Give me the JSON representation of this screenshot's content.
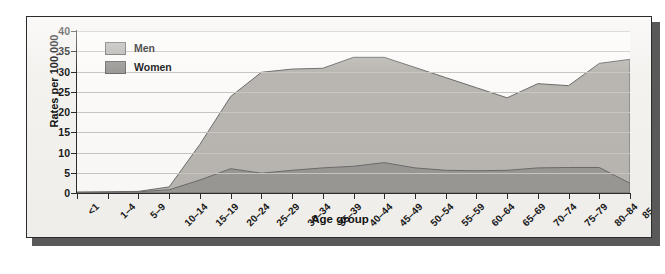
{
  "figure": {
    "xlabel": "Age group",
    "ylabel": "Rates per 100,000"
  },
  "legend": {
    "items": [
      {
        "label": "Men",
        "color": "#b9b6b1"
      },
      {
        "label": "Women",
        "color": "#9a9894"
      }
    ]
  },
  "chart_data": {
    "type": "area",
    "title": "",
    "xlabel": "Age group",
    "ylabel": "Rates per 100,000",
    "ylim": [
      0,
      40
    ],
    "yticks": [
      0,
      5,
      10,
      15,
      20,
      25,
      30,
      35,
      40
    ],
    "grid": true,
    "legend_position": "top-left",
    "stacked": false,
    "categories": [
      "<1",
      "1–4",
      "5–9",
      "10–14",
      "15–19",
      "20–24",
      "25–29",
      "30–34",
      "35–39",
      "40–44",
      "45–49",
      "50–54",
      "55–59",
      "60–64",
      "65–69",
      "70–74",
      "75–79",
      "80–84",
      "85+"
    ],
    "series": [
      {
        "name": "Men",
        "color": "#b9b6b1",
        "values": [
          0.2,
          0.3,
          0.4,
          1.5,
          12.0,
          23.8,
          29.8,
          30.6,
          30.8,
          33.5,
          33.5,
          31.0,
          28.5,
          26.0,
          23.5,
          27.0,
          26.5,
          32.0,
          33.0
        ]
      },
      {
        "name": "Women",
        "color": "#9a9894",
        "values": [
          0.2,
          0.2,
          0.3,
          0.8,
          3.2,
          6.0,
          4.9,
          5.6,
          6.2,
          6.6,
          7.5,
          6.2,
          5.6,
          5.5,
          5.6,
          6.2,
          6.3,
          6.3,
          2.4
        ]
      }
    ]
  }
}
